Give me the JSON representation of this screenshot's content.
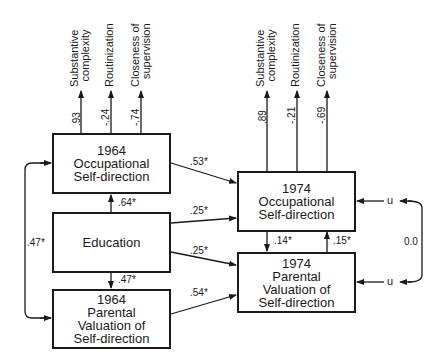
{
  "diagram": {
    "boxes": {
      "occ1964": {
        "lines": [
          "1964",
          "Occupational",
          "Self-direction"
        ]
      },
      "education": {
        "lines": [
          "Education"
        ]
      },
      "par1964": {
        "lines": [
          "1964",
          "Parental",
          "Valuation of",
          "Self-direction"
        ]
      },
      "occ1974": {
        "lines": [
          "1974",
          "Occupational",
          "Self-direction"
        ]
      },
      "par1974": {
        "lines": [
          "1974",
          "Parental",
          "Valuation of",
          "Self-direction"
        ]
      }
    },
    "indicators_1964": [
      {
        "label_lines": [
          "Substantive",
          "complexity"
        ],
        "loading": ".93"
      },
      {
        "label_lines": [
          "Routinization"
        ],
        "loading": "-.24"
      },
      {
        "label_lines": [
          "Closeness of",
          "supervision"
        ],
        "loading": "-.74"
      }
    ],
    "indicators_1974": [
      {
        "label_lines": [
          "Substantive",
          "complexity"
        ],
        "loading": ".89"
      },
      {
        "label_lines": [
          "Routinization"
        ],
        "loading": "-.21"
      },
      {
        "label_lines": [
          "Closeness of",
          "supervision"
        ],
        "loading": "-.69"
      }
    ],
    "paths": {
      "edu_to_occ1964": ".64*",
      "edu_to_par1964": ".47*",
      "occ1964_par1964_corr": ".47*",
      "occ1964_to_occ1974": ".53*",
      "edu_to_occ1974": ".25*",
      "edu_to_par1974": ".25*",
      "par1964_to_par1974": ".54*",
      "occ1974_to_par1974": ".14*",
      "par1974_to_occ1974": ".15*",
      "residual_corr": "0.0"
    },
    "residuals": {
      "occ1974": "u",
      "par1974": "u"
    }
  }
}
